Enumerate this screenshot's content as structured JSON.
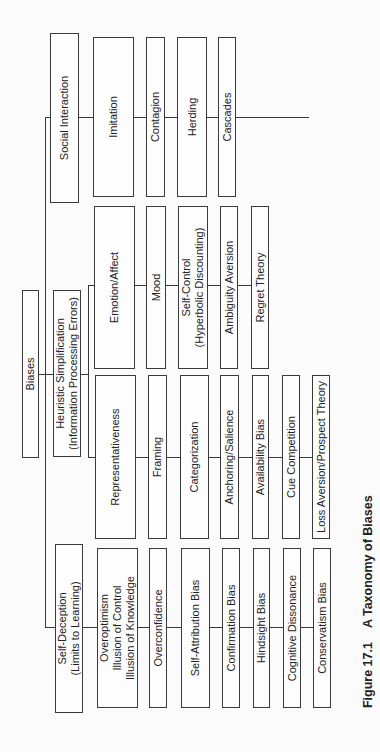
{
  "root": {
    "label": "Biases"
  },
  "categories": [
    {
      "label": "Social Interaction",
      "items": [
        "Imitation",
        "Contagion",
        "Herding",
        "Cascades"
      ]
    },
    {
      "label": "Heuristic Simplification\n(Information Processing Errors)",
      "groups": [
        {
          "items": [
            "Emotion/Affect",
            "Mood",
            "Self-Control\n(Hyperbolic Discounting)",
            "Ambiguity Aversion",
            "Regret Theory"
          ]
        },
        {
          "items": [
            "Representativeness",
            "Framing",
            "Categorization",
            "Anchoring/Salience",
            "Availability Bias",
            "Cue Competition",
            "Loss Aversion/Prospect Theory"
          ]
        }
      ]
    },
    {
      "label": "Self-Deception\n(Limits to Learning)",
      "items": [
        "Overoptimism\nIllusion of Control\nIllusion of Knowledge",
        "Overconfidence",
        "Self-Attribution Bias",
        "Confirmation Bias",
        "Hindsight Bias",
        "Cognitive Dissonance",
        "Conservatism Bias"
      ]
    }
  ],
  "caption": {
    "number": "Figure 17.1",
    "title": "A Taxonomy of Biases"
  },
  "colors": {
    "line": "#3a3a3a",
    "background": "#fbfbfb"
  }
}
